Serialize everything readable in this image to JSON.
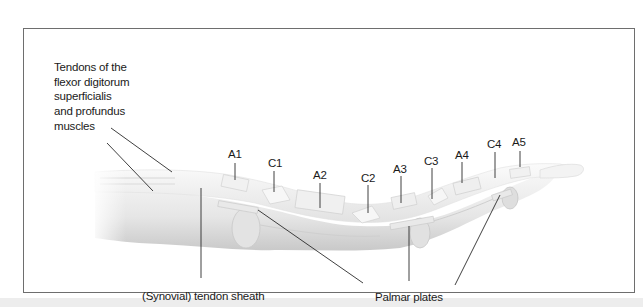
{
  "figure": {
    "title_labels": {
      "tendons": "Tendons of the\nflexor digitorum\nsuperficialis\nand profundus\nmuscles",
      "sheath": "(Synovial) tendon sheath",
      "palmar": "Palmar plates"
    },
    "pulleys": [
      {
        "id": "A1",
        "label": "A1",
        "x": 236,
        "y": 153,
        "tick_top": 163,
        "tick_bottom": 180
      },
      {
        "id": "C1",
        "label": "C1",
        "x": 275,
        "y": 161,
        "tick_top": 171,
        "tick_bottom": 192
      },
      {
        "id": "A2",
        "label": "A2",
        "x": 321,
        "y": 172,
        "tick_top": 183,
        "tick_bottom": 208
      },
      {
        "id": "C2",
        "label": "C2",
        "x": 369,
        "y": 174,
        "tick_top": 185,
        "tick_bottom": 213
      },
      {
        "id": "A3",
        "label": "A3",
        "x": 404,
        "y": 166,
        "tick_top": 176,
        "tick_bottom": 203
      },
      {
        "id": "C3",
        "label": "C3",
        "x": 434,
        "y": 158,
        "tick_top": 168,
        "tick_bottom": 199
      },
      {
        "id": "A4",
        "label": "A4",
        "x": 465,
        "y": 152,
        "tick_top": 162,
        "tick_bottom": 183
      },
      {
        "id": "C4",
        "label": "C4",
        "x": 496,
        "y": 142,
        "tick_top": 152,
        "tick_bottom": 178
      },
      {
        "id": "A5",
        "label": "A5",
        "x": 521,
        "y": 141,
        "tick_top": 151,
        "tick_bottom": 167
      }
    ],
    "colors": {
      "frame": "#6e6e6e",
      "leader": "#2a2a2a",
      "text": "#1a1a1a",
      "finger_light": "#f4f4f4",
      "finger_mid": "#dcdcdc",
      "finger_shadow": "#c4c4c4",
      "band": "#ededed"
    }
  }
}
